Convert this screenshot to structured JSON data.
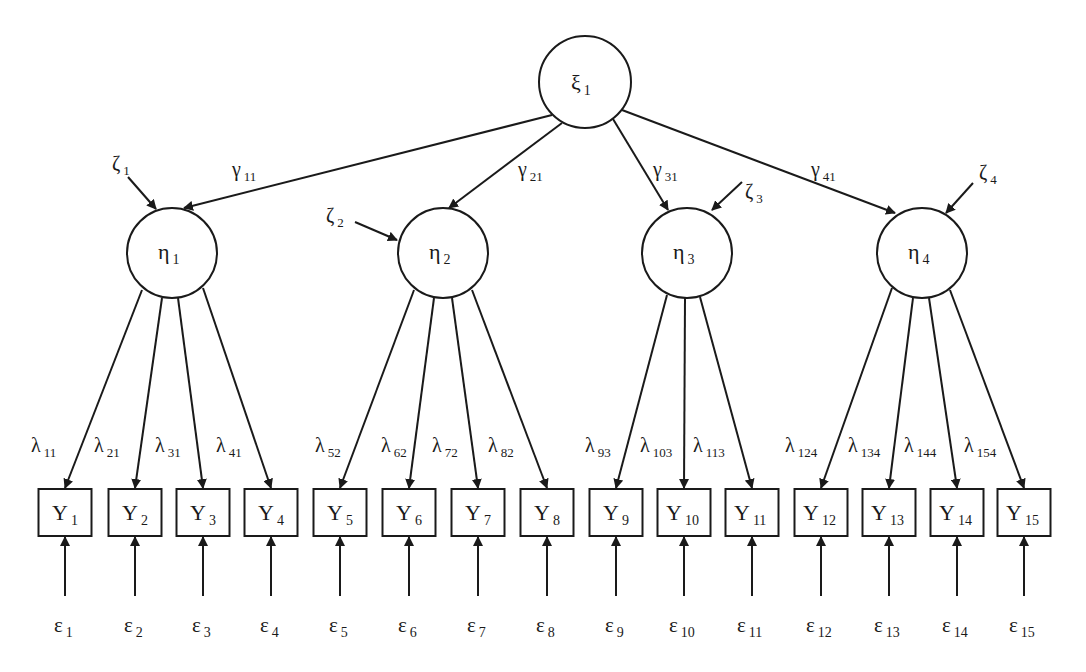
{
  "diagram": {
    "type": "structural-equation-model",
    "exogenous": {
      "id": "xi1",
      "symbol": "ξ",
      "sub": "1",
      "cx": 585,
      "cy": 82,
      "r": 46
    },
    "endogenous": [
      {
        "id": "eta1",
        "symbol": "η",
        "sub": "1",
        "cx": 172,
        "cy": 253,
        "r": 45
      },
      {
        "id": "eta2",
        "symbol": "η",
        "sub": "2",
        "cx": 443,
        "cy": 253,
        "r": 45
      },
      {
        "id": "eta3",
        "symbol": "η",
        "sub": "3",
        "cx": 687,
        "cy": 253,
        "r": 45
      },
      {
        "id": "eta4",
        "symbol": "η",
        "sub": "4",
        "cx": 922,
        "cy": 253,
        "r": 45
      }
    ],
    "structural_paths": [
      {
        "symbol": "γ",
        "sub": "11",
        "from": "xi1",
        "to": "eta1",
        "x1": 552,
        "y1": 115,
        "x2": 184,
        "y2": 208,
        "lx": 232,
        "ly": 176
      },
      {
        "symbol": "γ",
        "sub": "21",
        "from": "xi1",
        "to": "eta2",
        "x1": 562,
        "y1": 123,
        "x2": 449,
        "y2": 208,
        "lx": 518,
        "ly": 176
      },
      {
        "symbol": "γ",
        "sub": "31",
        "from": "xi1",
        "to": "eta3",
        "x1": 613,
        "y1": 119,
        "x2": 668,
        "y2": 210,
        "lx": 653,
        "ly": 176
      },
      {
        "symbol": "γ",
        "sub": "41",
        "from": "xi1",
        "to": "eta4",
        "x1": 622,
        "y1": 110,
        "x2": 895,
        "y2": 213,
        "lx": 811,
        "ly": 176
      }
    ],
    "disturbances": [
      {
        "symbol": "ζ",
        "sub": "1",
        "target": "eta1",
        "x1": 128,
        "y1": 177,
        "x2": 156,
        "y2": 209,
        "lx": 112,
        "ly": 170
      },
      {
        "symbol": "ζ",
        "sub": "2",
        "target": "eta2",
        "x1": 355,
        "y1": 222,
        "x2": 397,
        "y2": 240,
        "lx": 326,
        "ly": 222
      },
      {
        "symbol": "ζ",
        "sub": "3",
        "target": "eta3",
        "x1": 742,
        "y1": 182,
        "x2": 712,
        "y2": 210,
        "lx": 745,
        "ly": 198
      },
      {
        "symbol": "ζ",
        "sub": "4",
        "target": "eta4",
        "x1": 973,
        "y1": 183,
        "x2": 946,
        "y2": 213,
        "lx": 979,
        "ly": 179
      }
    ],
    "indicators": [
      {
        "label": "Y",
        "sub": "1",
        "cx": 65
      },
      {
        "label": "Y",
        "sub": "2",
        "cx": 135
      },
      {
        "label": "Y",
        "sub": "3",
        "cx": 203
      },
      {
        "label": "Y",
        "sub": "4",
        "cx": 271
      },
      {
        "label": "Y",
        "sub": "5",
        "cx": 340
      },
      {
        "label": "Y",
        "sub": "6",
        "cx": 409
      },
      {
        "label": "Y",
        "sub": "7",
        "cx": 478
      },
      {
        "label": "Y",
        "sub": "8",
        "cx": 547
      },
      {
        "label": "Y",
        "sub": "9",
        "cx": 616
      },
      {
        "label": "Y",
        "sub": "10",
        "cx": 684
      },
      {
        "label": "Y",
        "sub": "11",
        "cx": 752
      },
      {
        "label": "Y",
        "sub": "12",
        "cx": 821
      },
      {
        "label": "Y",
        "sub": "13",
        "cx": 889
      },
      {
        "label": "Y",
        "sub": "14",
        "cx": 957
      },
      {
        "label": "Y",
        "sub": "15",
        "cx": 1024
      }
    ],
    "box": {
      "width": 53,
      "height": 47,
      "top": 489
    },
    "loadings": [
      {
        "symbol": "λ",
        "sub": "11",
        "x1": 142,
        "y1": 290,
        "ind": 0,
        "lx": 31
      },
      {
        "symbol": "λ",
        "sub": "21",
        "x1": 162,
        "y1": 298,
        "ind": 1,
        "lx": 94
      },
      {
        "symbol": "λ",
        "sub": "31",
        "x1": 178,
        "y1": 298,
        "ind": 2,
        "lx": 155
      },
      {
        "symbol": "λ",
        "sub": "41",
        "x1": 203,
        "y1": 288,
        "ind": 3,
        "lx": 216
      },
      {
        "symbol": "λ",
        "sub": "52",
        "x1": 414,
        "y1": 290,
        "ind": 4,
        "lx": 315
      },
      {
        "symbol": "λ",
        "sub": "62",
        "x1": 434,
        "y1": 298,
        "ind": 5,
        "lx": 381
      },
      {
        "symbol": "λ",
        "sub": "72",
        "x1": 452,
        "y1": 298,
        "ind": 6,
        "lx": 432
      },
      {
        "symbol": "λ",
        "sub": "82",
        "x1": 472,
        "y1": 290,
        "ind": 7,
        "lx": 488
      },
      {
        "symbol": "λ",
        "sub": "93",
        "x1": 667,
        "y1": 295,
        "ind": 8,
        "lx": 585
      },
      {
        "symbol": "λ",
        "sub": "103",
        "x1": 685,
        "y1": 298,
        "ind": 9,
        "lx": 640
      },
      {
        "symbol": "λ",
        "sub": "113",
        "x1": 700,
        "y1": 297,
        "ind": 10,
        "lx": 693
      },
      {
        "symbol": "λ",
        "sub": "124",
        "x1": 892,
        "y1": 288,
        "ind": 11,
        "lx": 785
      },
      {
        "symbol": "λ",
        "sub": "134",
        "x1": 913,
        "y1": 298,
        "ind": 12,
        "lx": 848
      },
      {
        "symbol": "λ",
        "sub": "144",
        "x1": 929,
        "y1": 298,
        "ind": 13,
        "lx": 904
      },
      {
        "symbol": "λ",
        "sub": "154",
        "x1": 950,
        "y1": 290,
        "ind": 14,
        "lx": 964
      }
    ],
    "loading_label_y": 452,
    "errors": [
      {
        "symbol": "ε",
        "sub": "1"
      },
      {
        "symbol": "ε",
        "sub": "2"
      },
      {
        "symbol": "ε",
        "sub": "3"
      },
      {
        "symbol": "ε",
        "sub": "4"
      },
      {
        "symbol": "ε",
        "sub": "5"
      },
      {
        "symbol": "ε",
        "sub": "6"
      },
      {
        "symbol": "ε",
        "sub": "7"
      },
      {
        "symbol": "ε",
        "sub": "8"
      },
      {
        "symbol": "ε",
        "sub": "9"
      },
      {
        "symbol": "ε",
        "sub": "10"
      },
      {
        "symbol": "ε",
        "sub": "11"
      },
      {
        "symbol": "ε",
        "sub": "12"
      },
      {
        "symbol": "ε",
        "sub": "13"
      },
      {
        "symbol": "ε",
        "sub": "14"
      },
      {
        "symbol": "ε",
        "sub": "15"
      }
    ],
    "error_arrow": {
      "y_start": 596,
      "y_end": 537
    },
    "error_label_y": 632,
    "colors": {
      "stroke": "#1a1a1a",
      "fill": "#ffffff",
      "background": "#ffffff"
    }
  }
}
